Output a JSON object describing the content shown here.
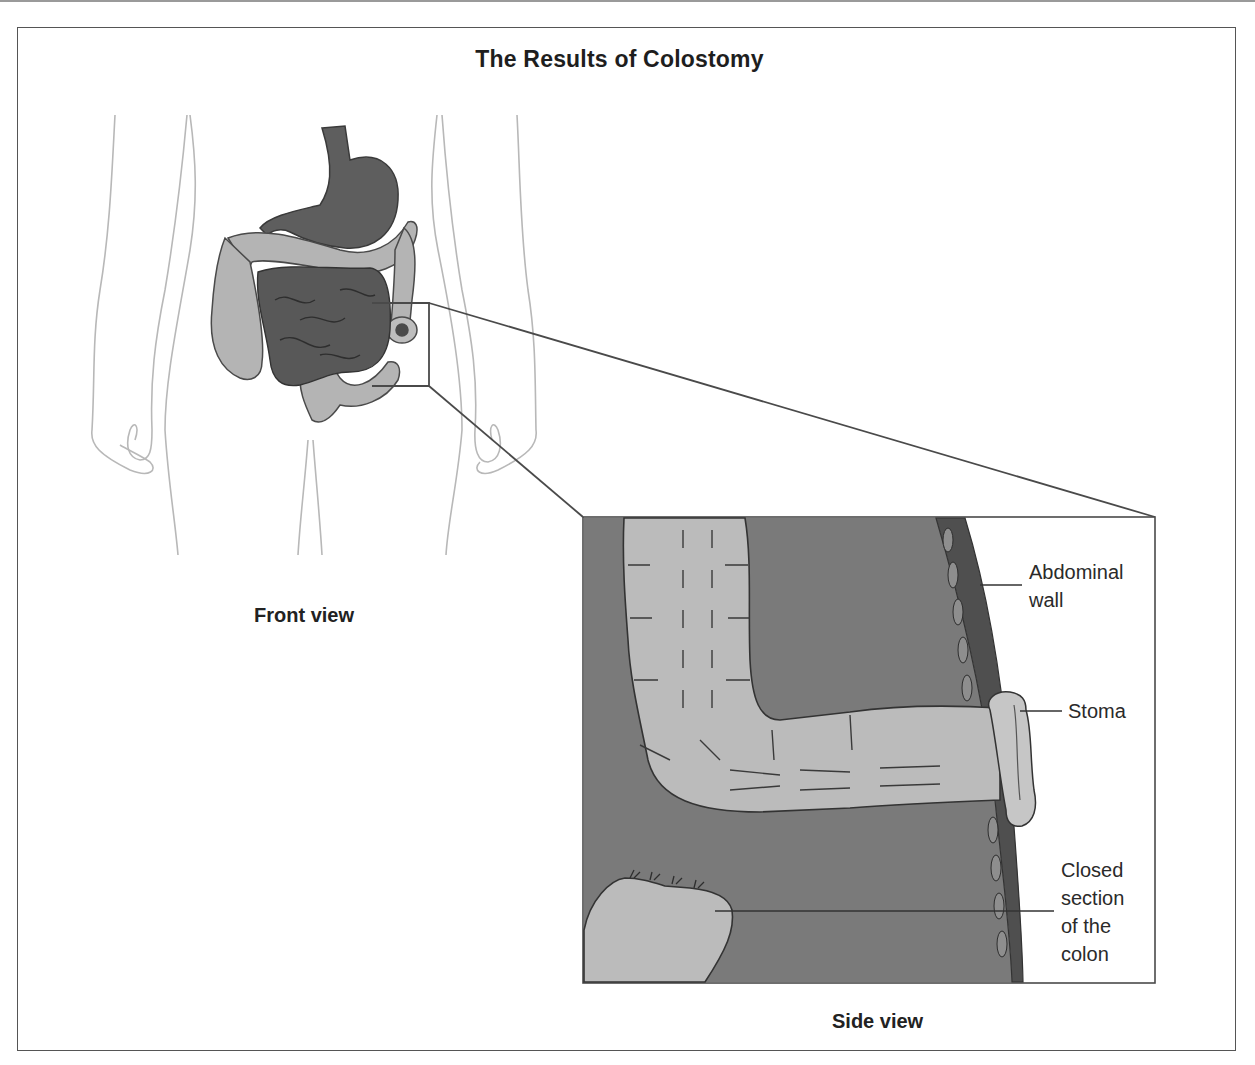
{
  "figure": {
    "title": "The Results of Colostomy",
    "captions": {
      "front_view": "Front view",
      "side_view": "Side view"
    },
    "labels": {
      "abdominal_wall_line1": "Abdominal",
      "abdominal_wall_line2": "wall",
      "stoma": "Stoma",
      "closed_section_line1": "Closed",
      "closed_section_line2": "section",
      "closed_section_line3": "of the",
      "closed_section_line4": "colon"
    },
    "colors": {
      "background": "#ffffff",
      "frame": "#555555",
      "body_outline": "#b5b5b5",
      "colon_fill": "#b4b4b4",
      "small_intestine_fill": "#5a5a5a",
      "stomach_fill": "#5e5e5e",
      "side_view_background": "#7a7a7a",
      "abdominal_wall_band": "#4f4f4f",
      "text": "#222222"
    }
  }
}
